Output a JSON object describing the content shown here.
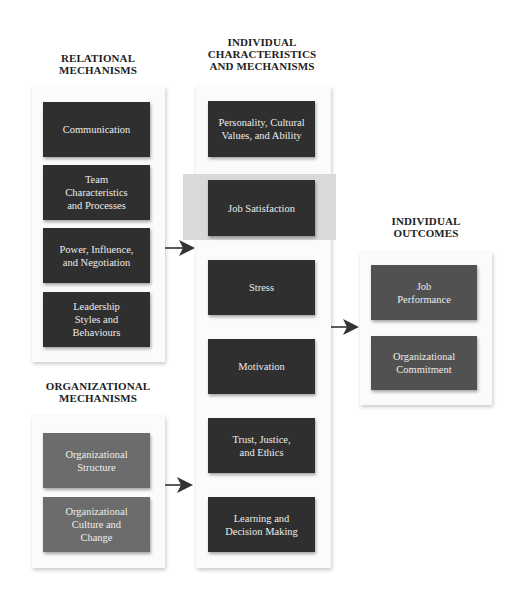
{
  "colors": {
    "dark_box": "#2f2f2f",
    "outcome_box": "#515151",
    "organizational_box": "#6c6c6c",
    "highlight_band": "#d9d9d9",
    "panel": "#fbfbfb",
    "arrow": "#333333"
  },
  "relational": {
    "heading": "RELATIONAL\nMECHANISMS",
    "items": [
      {
        "label": "Communication"
      },
      {
        "label": "Team\nCharacteristics\nand Processes"
      },
      {
        "label": "Power, Influence,\nand Negotiation"
      },
      {
        "label": "Leadership\nStyles and\nBehaviours"
      }
    ]
  },
  "organizational": {
    "heading": "ORGANIZATIONAL\nMECHANISMS",
    "items": [
      {
        "label": "Organizational\nStructure"
      },
      {
        "label": "Organizational\nCulture and\nChange"
      }
    ]
  },
  "individual": {
    "heading": "INDIVIDUAL\nCHARACTERISTICS\nAND MECHANISMS",
    "highlighted": "Job Satisfaction",
    "items": [
      {
        "label": "Personality, Cultural\nValues, and Ability"
      },
      {
        "label": "Job Satisfaction"
      },
      {
        "label": "Stress"
      },
      {
        "label": "Motivation"
      },
      {
        "label": "Trust, Justice,\nand Ethics"
      },
      {
        "label": "Learning and\nDecision Making"
      }
    ]
  },
  "outcomes": {
    "heading": "INDIVIDUAL\nOUTCOMES",
    "items": [
      {
        "label": "Job\nPerformance"
      },
      {
        "label": "Organizational\nCommitment"
      }
    ]
  },
  "arrows": [
    {
      "from": "relational",
      "to": "individual"
    },
    {
      "from": "individual",
      "to": "outcomes"
    },
    {
      "from": "organizational",
      "to": "individual"
    }
  ]
}
